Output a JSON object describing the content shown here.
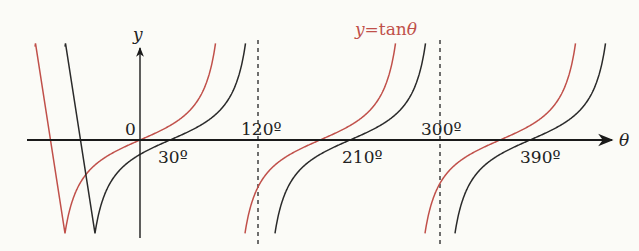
{
  "chart_data": {
    "type": "line",
    "title": "",
    "xlabel": "θ",
    "ylabel": "y",
    "origin_label": "0",
    "x_unit": "degrees",
    "xlim": [
      -125,
      470
    ],
    "ylim": [
      -4,
      4
    ],
    "grid": false,
    "legend": {
      "entries": [
        "y=tanθ"
      ],
      "position": "top-center annotation in red"
    },
    "tick_labels": [
      {
        "value": 30,
        "label": "30º",
        "position": "below"
      },
      {
        "value": 120,
        "label": "120º",
        "position": "above"
      },
      {
        "value": 210,
        "label": "210º",
        "position": "below"
      },
      {
        "value": 300,
        "label": "300º",
        "position": "above"
      },
      {
        "value": 390,
        "label": "390º",
        "position": "below"
      }
    ],
    "asymptotes": [
      {
        "x": 120,
        "style": "dashed",
        "belongs_to": "black curve"
      },
      {
        "x": 300,
        "style": "dashed",
        "belongs_to": "black curve"
      }
    ],
    "series": [
      {
        "name": "y=tanθ",
        "color": "#c0504a",
        "function": "tan(θ)",
        "zeros": [
          0,
          180,
          360
        ],
        "asymptotes": [
          -90,
          90,
          270,
          450
        ],
        "branches": [
          [
            -105,
            77
          ],
          [
            103,
            257
          ],
          [
            283,
            437
          ]
        ]
      },
      {
        "name": "y=tan(θ-30º)",
        "color": "#2a2a2a",
        "function": "tan(θ-30º)",
        "zeros": [
          30,
          210,
          390
        ],
        "asymptotes": [
          -60,
          120,
          300,
          480
        ],
        "branches": [
          [
            -75,
            107
          ],
          [
            133,
            287
          ],
          [
            313,
            467
          ]
        ]
      }
    ]
  },
  "labels": {
    "y_axis": "y",
    "x_axis": "θ",
    "origin": "0",
    "legend_y": "y",
    "legend_eq": "=",
    "legend_fn": "tan",
    "legend_theta": "θ",
    "t30": "30º",
    "t120": "120º",
    "t210": "210º",
    "t300": "300º",
    "t390": "390º"
  },
  "colors": {
    "red": "#c0504a",
    "black": "#2a2a2a",
    "axis": "#1a1a1a"
  }
}
